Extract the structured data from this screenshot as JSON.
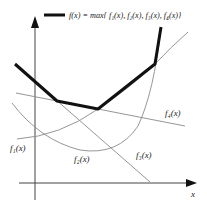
{
  "legend": {
    "formula": "f(x) = max{ f₁(x), f₂(x), f₃(x), f₄(x)}"
  },
  "labels": {
    "f1": "f₁(x)",
    "f2": "f₂(x)",
    "f3": "f₃(x)",
    "f4": "f₄(x)",
    "x_axis": "x"
  },
  "colors": {
    "max_curve": "#111111",
    "component_curves": "#888888",
    "axes": "#444444"
  }
}
